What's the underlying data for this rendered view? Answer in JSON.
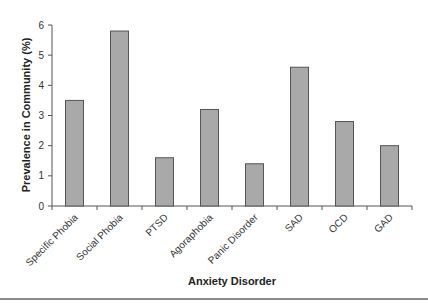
{
  "chart_data": {
    "type": "bar",
    "title": "",
    "xlabel": "Anxiety Disorder",
    "ylabel": "Prevalence in Community (%)",
    "categories": [
      "Specific Phobia",
      "Social Phobia",
      "PTSD",
      "Agoraphobia",
      "Panic Disorder",
      "SAD",
      "OCD",
      "GAD"
    ],
    "values": [
      3.5,
      5.8,
      1.6,
      3.2,
      1.4,
      4.6,
      2.8,
      2.0
    ],
    "ylim": [
      0,
      6
    ],
    "yticks": [
      0,
      1,
      2,
      3,
      4,
      5,
      6
    ],
    "grid": false,
    "legend": null,
    "bar_color": "#a9a9a9",
    "bar_edge_color": "#555555"
  },
  "layout": {
    "plot_left": 52,
    "plot_right": 412,
    "plot_top": 25,
    "plot_bottom": 206,
    "bar_width": 18
  }
}
